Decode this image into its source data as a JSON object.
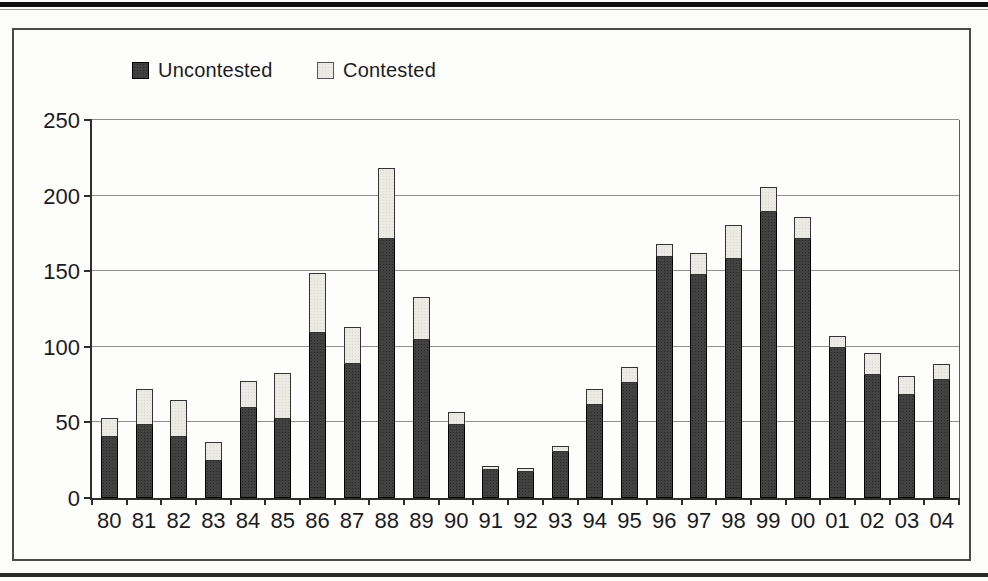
{
  "figure": {
    "type": "scanned-book-figure",
    "background": "#fdfdfc",
    "top_rule_color": "#111111",
    "bottom_rule_color": "#2a2a2a",
    "frame_border_color": "#4a4a4a"
  },
  "legend": {
    "items": [
      {
        "label": "Uncontested",
        "swatch": "dark"
      },
      {
        "label": "Contested",
        "swatch": "light"
      }
    ]
  },
  "colors": {
    "uncontested_fill": "#424242",
    "contested_fill": "#eceae5",
    "axis": "#2e2e2e",
    "gridline": "#8f8f8f",
    "text": "#1c1c1c"
  },
  "chart_data": {
    "type": "bar",
    "stacked": true,
    "title": "",
    "xlabel": "",
    "ylabel": "",
    "ylim": [
      0,
      250
    ],
    "y_ticks": [
      0,
      50,
      100,
      150,
      200,
      250
    ],
    "grid": true,
    "legend_position": "top-left",
    "categories": [
      "80",
      "81",
      "82",
      "83",
      "84",
      "85",
      "86",
      "87",
      "88",
      "89",
      "90",
      "91",
      "92",
      "93",
      "94",
      "95",
      "96",
      "97",
      "98",
      "99",
      "00",
      "01",
      "02",
      "03",
      "04"
    ],
    "series": [
      {
        "name": "Uncontested",
        "values": [
          41,
          49,
          41,
          25,
          60,
          53,
          110,
          89,
          172,
          105,
          49,
          19,
          18,
          31,
          62,
          77,
          160,
          148,
          159,
          190,
          172,
          100,
          82,
          69,
          79
        ]
      },
      {
        "name": "Contested",
        "values": [
          12,
          23,
          24,
          12,
          17,
          30,
          39,
          24,
          46,
          28,
          8,
          2,
          2,
          3,
          10,
          10,
          8,
          14,
          22,
          16,
          14,
          7,
          14,
          12,
          10
        ]
      }
    ]
  }
}
